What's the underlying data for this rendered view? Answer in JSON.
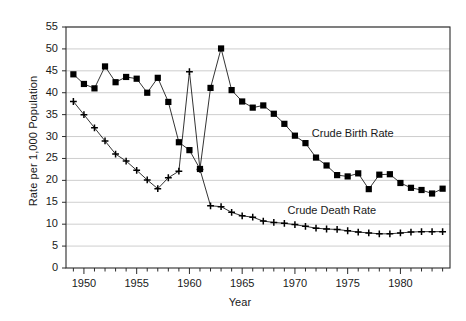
{
  "chart_data": {
    "type": "line",
    "title": "",
    "xlabel": "Year",
    "ylabel": "Rate per 1,000 Population",
    "xlim": [
      1948.3,
      1984.7
    ],
    "ylim": [
      0,
      55
    ],
    "ytick_labels": [
      "0",
      "5",
      "10",
      "15",
      "20",
      "25",
      "30",
      "35",
      "40",
      "45",
      "50",
      "55"
    ],
    "ytick_values": [
      0,
      5,
      10,
      15,
      20,
      25,
      30,
      35,
      40,
      45,
      50,
      55
    ],
    "xtick_labels": [
      "1950",
      "1955",
      "1960",
      "1965",
      "1970",
      "1975",
      "1980"
    ],
    "xtick_values": [
      1950,
      1955,
      1960,
      1965,
      1970,
      1975,
      1980
    ],
    "xtick_minor_step": 1,
    "grid": "horizontal",
    "legend_position": "inline-annotation",
    "x": [
      1949,
      1950,
      1951,
      1952,
      1953,
      1954,
      1955,
      1956,
      1957,
      1958,
      1959,
      1960,
      1961,
      1962,
      1963,
      1964,
      1965,
      1966,
      1967,
      1968,
      1969,
      1970,
      1971,
      1972,
      1973,
      1974,
      1975,
      1976,
      1977,
      1978,
      1979,
      1980,
      1981,
      1982,
      1983,
      1984
    ],
    "series": [
      {
        "name": "Crude Birth Rate",
        "marker": "square",
        "color": "#000000",
        "label_x": 1971.6,
        "label_y": 30.6,
        "values": [
          44.2,
          42.0,
          41.0,
          46.0,
          42.4,
          43.6,
          43.2,
          40.0,
          43.4,
          37.9,
          28.7,
          26.9,
          22.6,
          41.1,
          50.1,
          40.6,
          38.0,
          36.6,
          37.1,
          35.2,
          32.9,
          30.2,
          28.5,
          25.2,
          23.4,
          21.2,
          20.9,
          21.6,
          18.0,
          21.3,
          21.4,
          19.4,
          18.3,
          17.8,
          17.0,
          18.1
        ]
      },
      {
        "name": "Crude Death Rate",
        "marker": "plus",
        "color": "#000000",
        "label_x": 1969.3,
        "label_y": 13.1,
        "values": [
          38.0,
          35.0,
          32.0,
          29.0,
          26.0,
          24.4,
          22.3,
          20.1,
          18.1,
          20.6,
          22.1,
          44.8,
          22.5,
          14.2,
          14.0,
          12.7,
          11.9,
          11.6,
          10.7,
          10.4,
          10.2,
          9.9,
          9.5,
          9.1,
          8.9,
          8.8,
          8.5,
          8.2,
          8.0,
          7.8,
          7.8,
          8.0,
          8.2,
          8.3,
          8.3,
          8.3
        ]
      }
    ]
  }
}
